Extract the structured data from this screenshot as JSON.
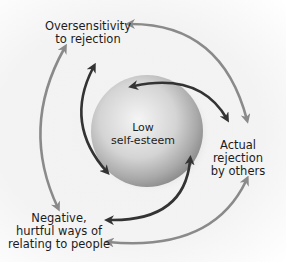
{
  "diagram": {
    "center_node": {
      "line1": "Low",
      "line2": "self-esteem"
    },
    "nodes": [
      {
        "id": "oversensitivity",
        "line1": "Oversensitivity",
        "line2": "to rejection"
      },
      {
        "id": "actual-rejection",
        "line1": "Actual",
        "line2": "rejection",
        "line3": "by others"
      },
      {
        "id": "negative-ways",
        "line1": "Negative,",
        "line2": "hurtful ways of",
        "line3": "relating to people"
      }
    ],
    "colors": {
      "outer_arrow": "#8a8a8a",
      "inner_arrow": "#3a3a3a",
      "sphere_light": "#f4f4f4",
      "sphere_dark": "#8c8c8c"
    }
  }
}
